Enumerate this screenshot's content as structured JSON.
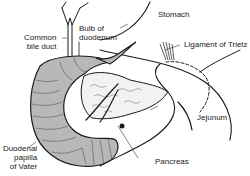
{
  "diagram": {
    "labels": {
      "stomach": "Stomach",
      "common_bile_duct_1": "Common",
      "common_bile_duct_2": "bile duct",
      "bulb_1": "Bulb of",
      "bulb_2": "duodenum",
      "ligament": "Ligament of Trietz",
      "jejunum": "Jejunum",
      "papilla_1": "Duodenal",
      "papilla_2": "papilla",
      "papilla_3": "of Vater",
      "pancreas": "Pancreas"
    },
    "colors": {
      "line": "#1a1a1a",
      "duodenum_fill": "#b8b8b8",
      "pancreas_fill": "#f2f2f2",
      "background": "#ffffff"
    }
  }
}
